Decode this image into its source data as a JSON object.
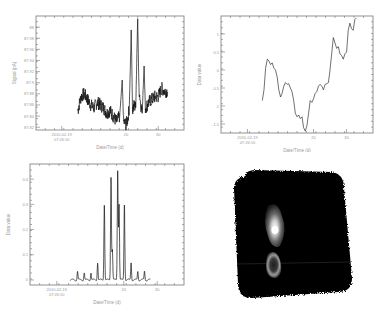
{
  "chart_data": [
    {
      "type": "line",
      "id": "top-left",
      "title": "",
      "xlabel": "Date/Time (d)",
      "ylabel": "Signal (pA)",
      "x_ticks": [
        {
          "pos": 0,
          "label": "2010-02-19\n07:26:10"
        },
        {
          "pos": 20,
          "label": "20"
        },
        {
          "pos": 30,
          "label": "30"
        }
      ],
      "xlim": [
        -8,
        38
      ],
      "y_ticks": [
        87.82,
        87.84,
        87.86,
        87.88,
        87.9,
        87.92,
        87.94,
        87.96,
        87.98,
        88
      ],
      "y_tick_labels": [
        "87.82",
        "87.84",
        "87.86",
        "87.88",
        "87.9",
        "87.92",
        "87.94",
        "87.96",
        "87.98",
        "88"
      ],
      "ylim": [
        87.815,
        88.02
      ],
      "x": [
        5,
        6,
        7,
        8,
        9,
        10,
        11,
        12,
        13,
        14,
        15,
        16,
        17,
        18,
        18.8,
        19.2,
        20,
        20.5,
        21,
        21.6,
        22,
        22.5,
        23,
        23.6,
        24,
        24.6,
        25,
        25.6,
        26,
        26.6,
        27,
        28,
        29,
        30,
        31,
        32,
        33
      ],
      "values": [
        87.85,
        87.875,
        87.88,
        87.87,
        87.86,
        87.855,
        87.865,
        87.86,
        87.855,
        87.845,
        87.85,
        87.84,
        87.83,
        87.84,
        87.905,
        87.83,
        87.825,
        87.835,
        87.855,
        87.995,
        87.85,
        87.86,
        87.855,
        88.015,
        87.89,
        87.86,
        87.845,
        87.93,
        87.855,
        87.86,
        87.865,
        87.87,
        87.875,
        87.875,
        87.89,
        87.885,
        87.885
      ],
      "noise_amplitude": 0.012,
      "grid": false
    },
    {
      "type": "line",
      "id": "top-right",
      "title": "",
      "xlabel": "Date/Time (d)",
      "ylabel": "Data value",
      "x_ticks": [
        {
          "pos": 0,
          "label": "2010-02-19\n07:26:10"
        },
        {
          "pos": 20,
          "label": "20"
        },
        {
          "pos": 30,
          "label": "30"
        }
      ],
      "xlim": [
        -8,
        38
      ],
      "y_ticks": [
        -1.5,
        -1,
        -0.5,
        0,
        0.5,
        1
      ],
      "y_tick_labels": [
        "-1.5",
        "-1",
        "-0.5",
        "0",
        "0.5",
        "1"
      ],
      "ylim": [
        -1.75,
        1.5
      ],
      "x": [
        4.5,
        5,
        5.5,
        6,
        6.5,
        7,
        7.5,
        8,
        8.5,
        9,
        9.5,
        10,
        10.5,
        11,
        11.5,
        12,
        12.5,
        13,
        13.5,
        14,
        14.5,
        15,
        15.5,
        16,
        16.5,
        17,
        17.5,
        18,
        18.5,
        19,
        19.5,
        20,
        20.5,
        21,
        21.5,
        22,
        22.5,
        23,
        23.5,
        24,
        24.5,
        25,
        25.5,
        26,
        26.5,
        27,
        27.5,
        28,
        28.5,
        29,
        29.5,
        30,
        30.5,
        31,
        31.5,
        32,
        32.5,
        33
      ],
      "values": [
        -0.85,
        -0.55,
        0.05,
        0.3,
        0.25,
        0.15,
        0.2,
        0.05,
        0.0,
        -0.2,
        -0.55,
        -0.75,
        -0.65,
        -0.45,
        -0.35,
        -0.4,
        -0.38,
        -0.5,
        -0.6,
        -0.85,
        -1.2,
        -1.3,
        -1.25,
        -1.35,
        -1.3,
        -1.6,
        -1.7,
        -1.55,
        -1.2,
        -0.85,
        -0.9,
        -0.8,
        -0.65,
        -0.6,
        -0.45,
        -0.4,
        -0.45,
        -0.55,
        -0.4,
        -0.38,
        -0.35,
        0.0,
        0.45,
        0.9,
        0.75,
        0.6,
        0.65,
        0.45,
        0.4,
        0.3,
        0.45,
        0.5,
        1.1,
        1.3,
        1.15,
        1.1,
        1.4,
        1.45
      ],
      "grid": false
    },
    {
      "type": "line",
      "id": "bottom-left",
      "title": "",
      "xlabel": "Date/Time (d)",
      "ylabel": "Data value",
      "x_ticks": [
        {
          "pos": 0,
          "label": "2010-02-19\n07:26:10"
        },
        {
          "pos": 20,
          "label": "20"
        },
        {
          "pos": 30,
          "label": "30"
        }
      ],
      "xlim": [
        -8,
        38
      ],
      "y_ticks": [
        0,
        0.1,
        0.2,
        0.3,
        0.4
      ],
      "y_tick_labels": [
        "0",
        "0.1",
        "0.2",
        "0.3",
        "0.4"
      ],
      "ylim": [
        -0.02,
        0.46
      ],
      "peaks": [
        {
          "x": 6.2,
          "h": 0.035
        },
        {
          "x": 8.2,
          "h": 0.03
        },
        {
          "x": 10.2,
          "h": 0.03
        },
        {
          "x": 12.2,
          "h": 0.07
        },
        {
          "x": 14.2,
          "h": 0.3
        },
        {
          "x": 16.2,
          "h": 0.41
        },
        {
          "x": 16.6,
          "h": 0.12
        },
        {
          "x": 18.2,
          "h": 0.435
        },
        {
          "x": 18.6,
          "h": 0.3
        },
        {
          "x": 20.2,
          "h": 0.3
        },
        {
          "x": 22.2,
          "h": 0.07
        },
        {
          "x": 24.2,
          "h": 0.035
        },
        {
          "x": 26.2,
          "h": 0.035
        }
      ],
      "baseline": 0.0,
      "x_range": [
        4,
        28
      ],
      "grid": false
    }
  ],
  "image_panel": {
    "id": "bottom-right",
    "description": "grayscale rotated square image with two bright blobs",
    "colors": {
      "background": "#000000",
      "blob_outer": "#8a8a8a",
      "blob_inner": "#ffffff"
    }
  },
  "colors": {
    "axis": "#777777",
    "text": "#9a9a9a",
    "trace": "#111111"
  }
}
